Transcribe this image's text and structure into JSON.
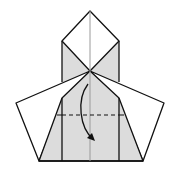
{
  "diagram": {
    "title": "",
    "type": "origami-fold-diagram",
    "colors": {
      "paper_front": "#ffffff",
      "paper_back": "#dcdcdc",
      "line": "#111111",
      "center_crease": "#999999"
    },
    "elements": [
      {
        "name": "top-square",
        "description": "white diamond flap at top"
      },
      {
        "name": "upper-gray-triangles",
        "description": "gray side triangles of upper flap"
      },
      {
        "name": "left-wing",
        "description": "white left pentagon wing"
      },
      {
        "name": "right-wing",
        "description": "white right pentagon wing"
      },
      {
        "name": "body",
        "description": "gray central trapezoid body"
      },
      {
        "name": "valley-fold-line",
        "description": "dashed horizontal valley fold"
      },
      {
        "name": "fold-arrow",
        "description": "curved arrow pointing down"
      },
      {
        "name": "center-crease",
        "description": "vertical center crease"
      }
    ]
  }
}
